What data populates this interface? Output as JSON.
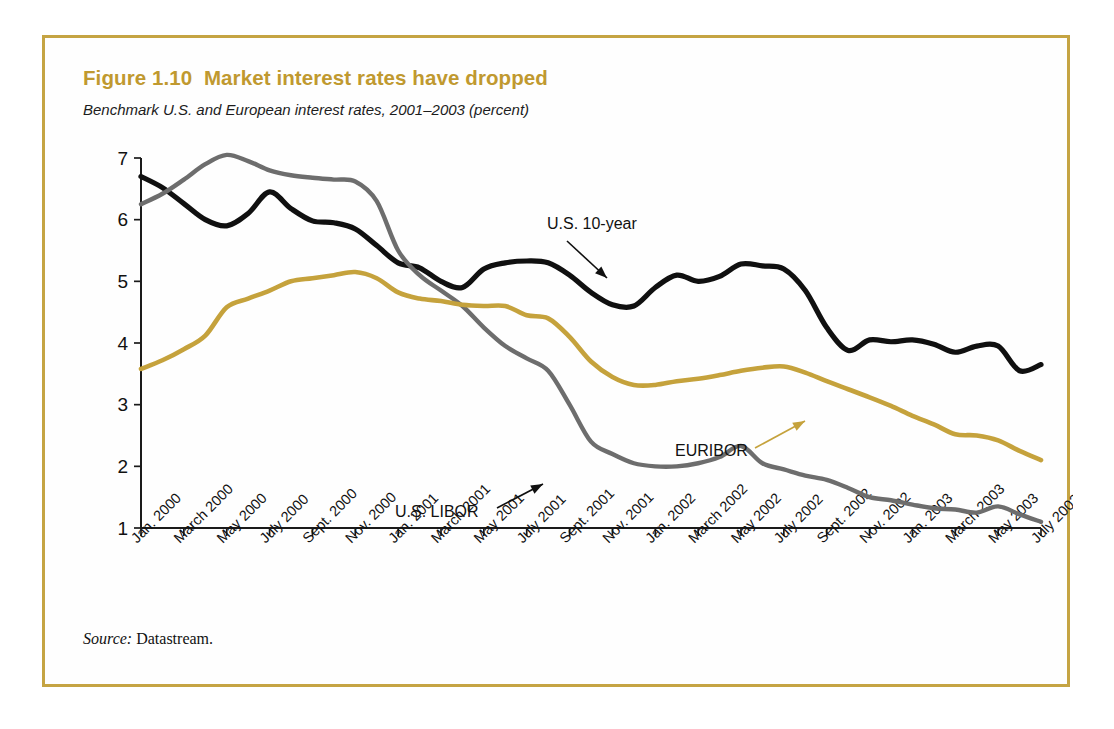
{
  "figure": {
    "title": "Figure 1.10  Market interest rates have dropped",
    "subtitle": "Benchmark U.S. and European interest rates, 2001–2003 (percent)",
    "source_prefix": "Source:",
    "source_text": " Datastream.",
    "border_color": "#c5a443",
    "title_color": "#c0992f"
  },
  "chart_data": {
    "type": "line",
    "title": "Figure 1.10  Market interest rates have dropped",
    "subtitle": "Benchmark U.S. and European interest rates, 2001–2003 (percent)",
    "xlabel": "",
    "ylabel": "percent",
    "ylim": [
      1,
      7
    ],
    "yticks": [
      1,
      2,
      3,
      4,
      5,
      6,
      7
    ],
    "grid": false,
    "legend_position": "inline-annotations",
    "x": [
      "Jan. 2000",
      "Feb. 2000",
      "March 2000",
      "April 2000",
      "May 2000",
      "June 2000",
      "July 2000",
      "Aug. 2000",
      "Sept. 2000",
      "Oct. 2000",
      "Nov. 2000",
      "Dec. 2000",
      "Jan. 2001",
      "Feb. 2001",
      "March 2001",
      "April 2001",
      "May 2001",
      "June 2001",
      "July 2001",
      "Aug. 2001",
      "Sept. 2001",
      "Oct. 2001",
      "Nov. 2001",
      "Dec. 2001",
      "Jan. 2002",
      "Feb. 2002",
      "March 2002",
      "April 2002",
      "May 2002",
      "June 2002",
      "July 2002",
      "Aug. 2002",
      "Sept. 2002",
      "Oct. 2002",
      "Nov. 2002",
      "Dec. 2002",
      "Jan. 2003",
      "Feb. 2003",
      "March 2003",
      "April 2003",
      "May 2003",
      "June 2003",
      "July 2003"
    ],
    "xtick_labels": [
      "Jan. 2000",
      "March 2000",
      "May 2000",
      "July 2000",
      "Sept. 2000",
      "Nov. 2000",
      "Jan. 2001",
      "March 2001",
      "May 2001",
      "July 2001",
      "Sept. 2001",
      "Nov. 2001",
      "Jan. 2002",
      "March 2002",
      "May 2002",
      "July 2002",
      "Sept. 2002",
      "Nov. 2002",
      "Jan. 2003",
      "March 2003",
      "May 2003",
      "July 2003"
    ],
    "series": [
      {
        "name": "U.S. 10-year",
        "color": "#101010",
        "values": [
          6.7,
          6.52,
          6.26,
          6.0,
          5.9,
          6.1,
          6.45,
          6.18,
          5.98,
          5.95,
          5.85,
          5.58,
          5.3,
          5.22,
          5.0,
          4.9,
          5.2,
          5.3,
          5.33,
          5.3,
          5.1,
          4.82,
          4.62,
          4.6,
          4.9,
          5.1,
          5.0,
          5.08,
          5.28,
          5.25,
          5.2,
          4.85,
          4.25,
          3.88,
          4.05,
          4.02,
          4.05,
          3.98,
          3.85,
          3.95,
          3.95,
          3.55,
          3.65
        ]
      },
      {
        "name": "U.S. LIBOR",
        "color": "#6d6d6d",
        "values": [
          6.25,
          6.42,
          6.65,
          6.9,
          7.05,
          6.95,
          6.8,
          6.72,
          6.68,
          6.65,
          6.62,
          6.3,
          5.5,
          5.1,
          4.85,
          4.6,
          4.25,
          3.95,
          3.75,
          3.55,
          3.0,
          2.4,
          2.2,
          2.05,
          2.0,
          2.0,
          2.05,
          2.15,
          2.33,
          2.05,
          1.95,
          1.85,
          1.78,
          1.65,
          1.5,
          1.45,
          1.38,
          1.32,
          1.3,
          1.25,
          1.35,
          1.22,
          1.1
        ]
      },
      {
        "name": "EURIBOR",
        "color": "#c5a23c",
        "values": [
          3.58,
          3.72,
          3.9,
          4.12,
          4.58,
          4.72,
          4.85,
          5.0,
          5.05,
          5.1,
          5.15,
          5.05,
          4.82,
          4.72,
          4.68,
          4.62,
          4.6,
          4.6,
          4.45,
          4.4,
          4.1,
          3.7,
          3.45,
          3.32,
          3.32,
          3.38,
          3.42,
          3.48,
          3.55,
          3.6,
          3.62,
          3.52,
          3.38,
          3.25,
          3.12,
          2.98,
          2.82,
          2.68,
          2.52,
          2.5,
          2.42,
          2.25,
          2.1
        ]
      }
    ]
  },
  "annotations": [
    {
      "id": "us-10-year",
      "label": "U.S. 10-year",
      "color": "#101010"
    },
    {
      "id": "us-libor",
      "label": "U.S. LIBOR",
      "color": "#101010"
    },
    {
      "id": "euribor",
      "label": "EURIBOR",
      "color": "#101010"
    }
  ]
}
